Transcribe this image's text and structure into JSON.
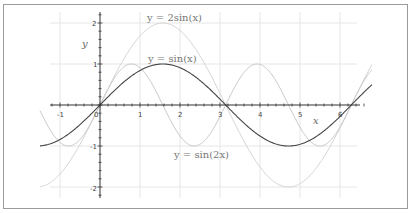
{
  "chart_data": {
    "type": "line",
    "title": "",
    "xlabel": "x",
    "ylabel": "y",
    "xlim": [
      -1.5,
      6.8
    ],
    "ylim": [
      -2.2,
      2.2
    ],
    "grid": true,
    "legend_position": "inline annotations",
    "x_ticks": [
      "-1",
      "0",
      "1",
      "2",
      "3",
      "4",
      "5",
      "6"
    ],
    "y_ticks": [
      "-2",
      "-1",
      "1",
      "2"
    ],
    "series": [
      {
        "name": "y = 2sin(x)",
        "expr": "2*sin(x)",
        "color": "#d4d4d4",
        "x": [
          -1.5,
          -1,
          0,
          0.5,
          1,
          1.5708,
          2,
          2.5,
          3,
          3.1416,
          4,
          4.7124,
          5,
          6,
          6.2832,
          6.8
        ],
        "values": [
          -1.99,
          -1.68,
          0,
          0.96,
          1.68,
          2.0,
          1.82,
          1.2,
          0.28,
          0,
          -1.51,
          -2.0,
          -1.92,
          -0.56,
          0,
          0.99
        ]
      },
      {
        "name": "y = sin(x)",
        "expr": "sin(x)",
        "color": "#444444",
        "x": [
          -1.5,
          -1,
          0,
          0.5,
          1,
          1.5708,
          2,
          2.5,
          3,
          3.1416,
          4,
          4.7124,
          5,
          6,
          6.2832,
          6.8
        ],
        "values": [
          -1.0,
          -0.84,
          0,
          0.48,
          0.84,
          1.0,
          0.91,
          0.6,
          0.14,
          0,
          -0.76,
          -1.0,
          -0.96,
          -0.28,
          0,
          0.49
        ]
      },
      {
        "name": "y = sin(2x)",
        "expr": "sin(2*x)",
        "color": "#c8c8c8",
        "x": [
          -1.5,
          -1,
          -0.7854,
          0,
          0.7854,
          1.5708,
          2.3562,
          3.1416,
          3.927,
          4.7124,
          5.4978,
          6.2832,
          6.8
        ],
        "values": [
          -0.14,
          -0.91,
          -1.0,
          0,
          1.0,
          0,
          -1.0,
          0,
          1.0,
          0,
          -1.0,
          0,
          0.86
        ]
      }
    ],
    "annotations": [
      {
        "text": "y = 2sin(x)",
        "x": 1.7,
        "y": 2.1
      },
      {
        "text": "y = sin(x)",
        "x": 1.7,
        "y": 1.1
      },
      {
        "text": "y = sin(2x)",
        "x": 1.6,
        "y": -1.15
      }
    ]
  },
  "labels": {
    "x_axis": "x",
    "y_axis": "y",
    "curve_2sin": "y = 2sin(x)",
    "curve_sin": "y = sin(x)",
    "curve_sin2x": "y = sin(2x)",
    "origin": "0",
    "x_ticks": [
      "-1",
      "1",
      "2",
      "3",
      "4",
      "5",
      "6"
    ],
    "y_ticks": [
      "2",
      "1",
      "-1",
      "-2"
    ]
  },
  "colors": {
    "grid": "#e6e6e6",
    "axis": "#333333",
    "frame": "#9a9a9a",
    "sin": "#444444",
    "two_sin": "#d4d4d4",
    "sin2x": "#c8c8c8"
  }
}
